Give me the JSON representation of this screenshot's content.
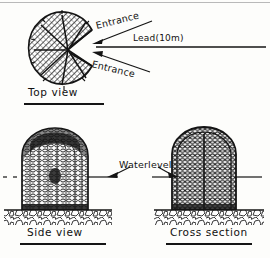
{
  "figure": {
    "kind": "scanned-line-drawing",
    "ink_color": "#141414",
    "paper_color": "#fdfdfb"
  },
  "annotations": {
    "entrance_top": "Entrance",
    "entrance_bottom": "Entrance",
    "lead": "Lead(10m)",
    "waterlevel": "Waterlevel"
  },
  "captions": {
    "top_view": "Top view",
    "side_view": "Side view",
    "cross_section": "Cross section"
  },
  "panels": [
    {
      "id": "top-view",
      "caption": "Top view",
      "description": "Circular hatched trap body divided by radial spokes, with a wedge-shaped funnel notch opening to the right",
      "callouts": [
        "Entrance",
        "Entrance",
        "Lead(10m)"
      ]
    },
    {
      "id": "side-view",
      "caption": "Side view",
      "description": "Dome-topped cylindrical mesh basket resting on a cobble stream bed, cut by the water level line",
      "callouts": [
        "Waterlevel"
      ]
    },
    {
      "id": "cross-section",
      "caption": "Cross section",
      "description": "Vertical cut through the dome-topped basket showing the central partition and dense woven mesh above a cobble bed",
      "callouts": [
        "Waterlevel"
      ]
    }
  ]
}
